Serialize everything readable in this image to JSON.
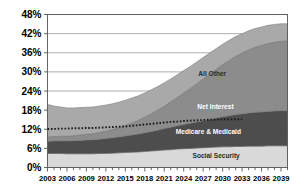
{
  "chart_data": {
    "type": "area",
    "title": "",
    "subtitle": "",
    "xlabel": "",
    "ylabel": "",
    "stacked": true,
    "grid": true,
    "legend_position": "inline-labels",
    "xlim": [
      2003,
      2040
    ],
    "ylim": [
      0,
      48
    ],
    "ytick_labels": [
      "0%",
      "6%",
      "12%",
      "18%",
      "24%",
      "30%",
      "36%",
      "42%",
      "48%"
    ],
    "ytick_values": [
      0,
      6,
      12,
      18,
      24,
      30,
      36,
      42,
      48
    ],
    "xtick_labels": [
      "2003",
      "2006",
      "2009",
      "2012",
      "2015",
      "2018",
      "2021",
      "2024",
      "2027",
      "2030",
      "2033",
      "2036",
      "2039"
    ],
    "xtick_values": [
      2003,
      2006,
      2009,
      2012,
      2015,
      2018,
      2021,
      2024,
      2027,
      2030,
      2033,
      2036,
      2039
    ],
    "minor_tick_interval": 1,
    "x": [
      2003,
      2004,
      2005,
      2006,
      2007,
      2008,
      2009,
      2010,
      2011,
      2012,
      2013,
      2014,
      2015,
      2016,
      2017,
      2018,
      2019,
      2020,
      2021,
      2022,
      2023,
      2024,
      2025,
      2026,
      2027,
      2028,
      2029,
      2030,
      2031,
      2032,
      2033,
      2034,
      2035,
      2036,
      2037,
      2038,
      2039,
      2040
    ],
    "series": [
      {
        "name": "Social Security",
        "color": "#d9d9d9",
        "label_color_mode": "dark",
        "values": [
          4.4,
          4.4,
          4.4,
          4.3,
          4.3,
          4.3,
          4.3,
          4.3,
          4.4,
          4.4,
          4.5,
          4.6,
          4.7,
          4.8,
          4.9,
          5.0,
          5.2,
          5.3,
          5.5,
          5.6,
          5.8,
          5.9,
          6.0,
          6.1,
          6.2,
          6.3,
          6.4,
          6.5,
          6.5,
          6.6,
          6.6,
          6.7,
          6.7,
          6.7,
          6.8,
          6.8,
          6.8,
          6.8
        ]
      },
      {
        "name": "Medicare & Medicaid",
        "color": "#4d4d4d",
        "label_color_mode": "light",
        "values": [
          3.8,
          3.9,
          3.9,
          4.0,
          4.1,
          4.2,
          4.3,
          4.4,
          4.5,
          4.7,
          4.8,
          5.0,
          5.2,
          5.4,
          5.6,
          5.9,
          6.1,
          6.4,
          6.7,
          7.0,
          7.3,
          7.6,
          7.9,
          8.2,
          8.5,
          8.8,
          9.1,
          9.4,
          9.7,
          10.0,
          10.2,
          10.4,
          10.6,
          10.7,
          10.8,
          10.9,
          11.0,
          11.0
        ]
      },
      {
        "name": "Net Interest",
        "color": "#8c8c8c",
        "label_color_mode": "light",
        "values": [
          1.4,
          1.4,
          1.5,
          1.5,
          1.6,
          1.7,
          1.8,
          1.9,
          2.1,
          2.3,
          2.6,
          2.9,
          3.3,
          3.8,
          4.3,
          4.9,
          5.6,
          6.3,
          7.1,
          8.0,
          8.9,
          9.9,
          10.9,
          12.0,
          13.1,
          14.2,
          15.3,
          16.4,
          17.4,
          18.3,
          19.1,
          19.8,
          20.4,
          20.9,
          21.3,
          21.6,
          21.8,
          21.9
        ]
      },
      {
        "name": "All Other",
        "color": "#a9a9a9",
        "label_color_mode": "dark",
        "values": [
          10.2,
          9.6,
          9.2,
          8.9,
          8.7,
          8.6,
          8.5,
          8.4,
          8.3,
          8.2,
          8.1,
          8.0,
          7.9,
          7.8,
          7.7,
          7.6,
          7.5,
          7.4,
          7.3,
          7.2,
          7.1,
          7.0,
          6.9,
          6.8,
          6.7,
          6.6,
          6.5,
          6.4,
          6.3,
          6.2,
          6.1,
          6.0,
          5.9,
          5.8,
          5.7,
          5.6,
          5.5,
          5.4
        ]
      }
    ],
    "totals": [
      19.8,
      19.3,
      19.0,
      18.7,
      18.7,
      18.8,
      18.9,
      19.0,
      19.3,
      19.6,
      20.0,
      20.5,
      21.1,
      21.8,
      22.5,
      23.4,
      24.4,
      25.4,
      26.6,
      27.8,
      29.1,
      30.4,
      31.7,
      33.1,
      34.5,
      35.9,
      37.3,
      38.7,
      39.9,
      41.1,
      42.0,
      42.9,
      43.6,
      44.1,
      44.6,
      44.9,
      45.1,
      45.1
    ],
    "annotations": [
      {
        "name": "revenue-line",
        "style": "dotted",
        "color": "#1a1a1a",
        "x_start": 2003,
        "x_end": 2033,
        "values": [
          12.1,
          12.1,
          12.2,
          12.2,
          12.3,
          12.3,
          12.4,
          12.4,
          12.5,
          12.6,
          12.7,
          12.8,
          12.9,
          13.1,
          13.3,
          13.5,
          13.7,
          13.9,
          14.1,
          14.3,
          14.4,
          14.6,
          14.7,
          14.8,
          14.9,
          15.0,
          15.0,
          15.1,
          15.1,
          15.1,
          15.1
        ]
      }
    ],
    "series_labels": [
      {
        "name": "All Other",
        "x": 2028.4,
        "y": 28.8
      },
      {
        "name": "Net Interest",
        "x": 2028.9,
        "y": 18.4
      },
      {
        "name": "Medicare & Medicaid",
        "x": 2027.8,
        "y": 10.6
      },
      {
        "name": "Social Security",
        "x": 2029.0,
        "y": 3.1
      }
    ],
    "colors": {
      "plot_border": "#555555",
      "gridline": "#9a9a9a",
      "axis": "#555555",
      "background": "#ffffff"
    }
  }
}
